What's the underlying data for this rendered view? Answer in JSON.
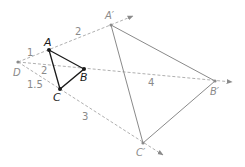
{
  "figure": {
    "colors": {
      "original_triangle": "#1a1a1a",
      "image_triangle": "#8a8a8a",
      "ray": "#b0b0b0",
      "label": "#8a8a8a"
    },
    "center": {
      "label": "D",
      "x": 18,
      "y": 62
    },
    "original_points": [
      {
        "label": "A",
        "x": 49,
        "y": 50
      },
      {
        "label": "B",
        "x": 84,
        "y": 69
      },
      {
        "label": "C",
        "x": 60,
        "y": 89
      }
    ],
    "image_points": [
      {
        "label": "A′",
        "x": 111,
        "y": 25
      },
      {
        "label": "B′",
        "x": 215,
        "y": 81
      },
      {
        "label": "C′",
        "x": 143,
        "y": 143
      }
    ],
    "segment_labels": [
      {
        "text": "1",
        "x": 30,
        "y": 54
      },
      {
        "text": "2",
        "x": 78,
        "y": 34
      },
      {
        "text": "2",
        "x": 43,
        "y": 74
      },
      {
        "text": "1.5",
        "x": 27,
        "y": 88
      },
      {
        "text": "3",
        "x": 82,
        "y": 118
      },
      {
        "text": "4",
        "x": 149,
        "y": 86
      }
    ]
  }
}
